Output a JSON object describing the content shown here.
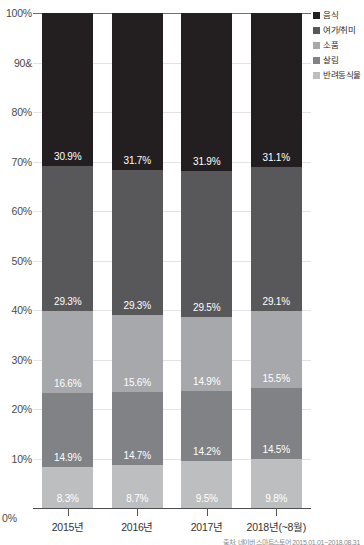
{
  "chart_data": {
    "type": "bar",
    "stacked": true,
    "stack_mode": "percent",
    "title": "",
    "xlabel": "",
    "ylabel": "",
    "ylim": [
      0,
      100
    ],
    "grid": true,
    "legend_position": "top-right",
    "categories": [
      "2015년",
      "2016년",
      "2017년",
      "2018년(~8월)"
    ],
    "ytick_labels": [
      "100%",
      "90&",
      "80%",
      "70%",
      "60%",
      "50%",
      "40%",
      "30%",
      "20%",
      "10%",
      "0%"
    ],
    "ytick_values": [
      100,
      90,
      80,
      70,
      60,
      50,
      40,
      30,
      20,
      10,
      0
    ],
    "series": [
      {
        "name": "음식",
        "color": "#231f20",
        "values": [
          30.9,
          31.7,
          31.9,
          31.1
        ],
        "labels": [
          "30.9%",
          "31.7%",
          "31.9%",
          "31.1%"
        ]
      },
      {
        "name": "여가/취미",
        "color": "#58585a",
        "values": [
          29.3,
          29.3,
          29.5,
          29.1
        ],
        "labels": [
          "29.3%",
          "29.3%",
          "29.5%",
          "29.1%"
        ]
      },
      {
        "name": "소품",
        "color": "#a6a8ab",
        "values": [
          16.6,
          15.6,
          14.9,
          15.5
        ],
        "labels": [
          "16.6%",
          "15.6%",
          "14.9%",
          "15.5%"
        ]
      },
      {
        "name": "살림",
        "color": "#808285",
        "values": [
          14.9,
          14.7,
          14.2,
          14.5
        ],
        "labels": [
          "14.9%",
          "14.7%",
          "14.2%",
          "14.5%"
        ]
      },
      {
        "name": "반려동식물",
        "color": "#bcbec0",
        "values": [
          8.3,
          8.7,
          9.5,
          9.8
        ],
        "labels": [
          "8.3%",
          "8.7%",
          "9.5%",
          "9.8%"
        ]
      }
    ]
  },
  "footnote": {
    "text": "출처: 네이버 스마트스토어 2015.01.01~2018.08.31"
  }
}
